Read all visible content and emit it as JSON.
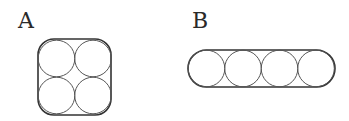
{
  "figures": [
    {
      "label": "A",
      "arrangement": "2x2 square packing",
      "circle_count": 4,
      "container": "rounded square"
    },
    {
      "label": "B",
      "arrangement": "1x4 linear packing",
      "circle_count": 4,
      "container": "stadium (rounded rectangle)"
    }
  ],
  "colors": {
    "stroke": "#333333",
    "background": "#ffffff"
  }
}
